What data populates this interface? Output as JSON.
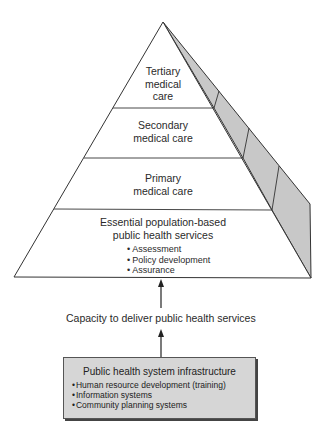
{
  "pyramid": {
    "levels": [
      {
        "label": "Tertiary medical care",
        "lines": [
          "Tertiary",
          "medical",
          "care"
        ]
      },
      {
        "label": "Secondary medical care",
        "lines": [
          "Secondary",
          "medical care"
        ]
      },
      {
        "label": "Primary medical care",
        "lines": [
          "Primary",
          "medical care"
        ]
      },
      {
        "label": "Essential population-based public health services",
        "lines": [
          "Essential population-based",
          "public health services"
        ],
        "bullets": [
          "Assessment",
          "Policy development",
          "Assurance"
        ]
      }
    ],
    "colors": {
      "side_face": "#c8c8c8",
      "outline": "#333333",
      "front_face": "#ffffff"
    }
  },
  "caption": "Capacity to deliver public health services",
  "infrastructure": {
    "title": "Public health system infrastructure",
    "bullets": [
      "Human resource development (training)",
      "Information systems",
      "Community planning systems"
    ],
    "fill_color": "#d6d6d6"
  }
}
